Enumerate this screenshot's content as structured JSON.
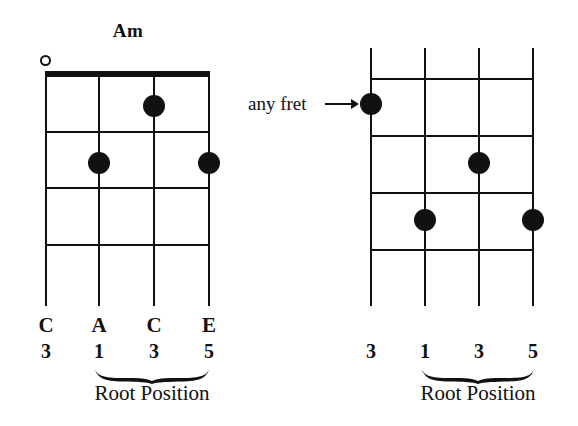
{
  "page": {
    "background_color": "#ffffff",
    "ink_color": "#111111",
    "width": 578,
    "height": 426
  },
  "diagrams": [
    {
      "id": "left-diagram",
      "title": "Am",
      "has_nut": true,
      "open_string_marker": "o",
      "open_string_index": 0,
      "string_count": 4,
      "fret_count": 4,
      "notes": [
        {
          "string": 2,
          "fret": 1,
          "symbol": "dot"
        },
        {
          "string": 1,
          "fret": 2,
          "symbol": "dot"
        },
        {
          "string": 3,
          "fret": 2,
          "symbol": "dot"
        }
      ],
      "note_labels": [
        "C",
        "A",
        "C",
        "E"
      ],
      "degree_labels": [
        "3",
        "1",
        "3",
        "5"
      ],
      "brace_caption": "Root Position",
      "brace_spans_strings": [
        1,
        3
      ]
    },
    {
      "id": "right-diagram",
      "title": "",
      "has_nut": false,
      "open_string_marker": "",
      "string_count": 4,
      "fret_count": 4,
      "annotation": "any fret",
      "annotation_arrow": "arrow-right",
      "notes": [
        {
          "string": 0,
          "fret": 1,
          "symbol": "dot"
        },
        {
          "string": 2,
          "fret": 2,
          "symbol": "dot"
        },
        {
          "string": 1,
          "fret": 3,
          "symbol": "dot"
        },
        {
          "string": 3,
          "fret": 3,
          "symbol": "dot"
        }
      ],
      "note_labels": [
        "",
        "",
        "",
        ""
      ],
      "degree_labels": [
        "3",
        "1",
        "3",
        "5"
      ],
      "brace_caption": "Root Position",
      "brace_spans_strings": [
        1,
        3
      ]
    }
  ]
}
